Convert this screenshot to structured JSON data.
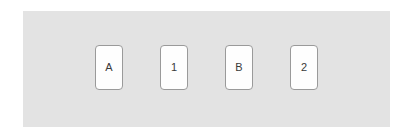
{
  "panel": {
    "background_color": "#e3e3e3",
    "page_background_color": "#ffffff"
  },
  "cards": {
    "border_color": "#9a9a9a",
    "face_color": "#fefefe",
    "label_color": "#3a3a3a",
    "items": [
      {
        "label": "A"
      },
      {
        "label": "1"
      },
      {
        "label": "B"
      },
      {
        "label": "2"
      }
    ]
  }
}
